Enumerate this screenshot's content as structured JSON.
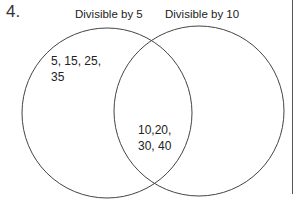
{
  "question": {
    "number": "4."
  },
  "venn": {
    "sets": [
      {
        "label": "Divisible by 5"
      },
      {
        "label": "Divisible by 10"
      }
    ],
    "regions": {
      "only_a": {
        "line1": "5, 15, 25,",
        "line2": "35"
      },
      "intersection": {
        "line1": "10,20,",
        "line2": "30, 40"
      },
      "only_b": {
        "line1": "",
        "line2": ""
      }
    },
    "stroke_color": "#444444"
  }
}
